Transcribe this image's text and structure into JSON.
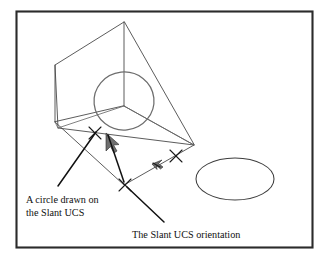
{
  "figure": {
    "background_color": "#ffffff",
    "border_color": "#2b2b2b",
    "line_color": "#4a4a4a",
    "annotation_color": "#111111"
  },
  "annotations": {
    "circle_label": {
      "line1": "A circle drawn on",
      "line2": "the Slant UCS"
    },
    "orientation_label": {
      "line1": "The Slant UCS orientation"
    }
  },
  "objects": {
    "slant_circle_name": "circle-on-slant-ucs",
    "world_ellipse_name": "ellipse-on-world-ucs",
    "wireframe_name": "slant-plane-wireframe",
    "ucs_icon_upper": "ucs-icon-upper",
    "ucs_icon_lower": "ucs-icon-lower",
    "pick_point_upper": "pick-point-upper",
    "pick_point_lower": "pick-point-lower",
    "pick_point_origin": "pick-point-origin"
  }
}
